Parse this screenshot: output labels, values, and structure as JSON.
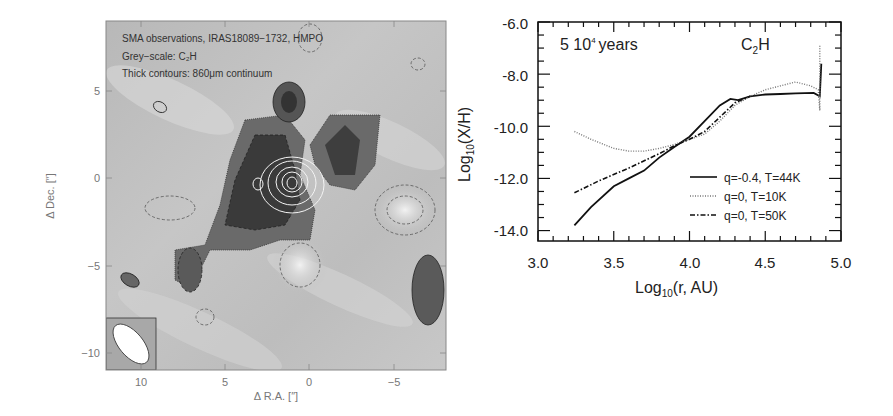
{
  "left_panel": {
    "annotations": [
      "SMA observations, IRAS18089−1732, HMPO",
      "Grey−scale: C₂H",
      "Thick contours: 860μm continuum"
    ],
    "xlabel": "Δ R.A. [″]",
    "ylabel": "Δ Dec. [″]",
    "xticks": [
      "10",
      "5",
      "0",
      "−5"
    ],
    "yticks": [
      "5",
      "0",
      "−5",
      "−10"
    ]
  },
  "chart_data": [
    {
      "type": "image",
      "title": "SMA observations, IRAS18089-1732, HMPO",
      "subtitle": [
        "Grey-scale: C2H",
        "Thick contours: 860μm continuum"
      ],
      "xlabel": "Δ R.A. [″]",
      "ylabel": "Δ Dec. [″]",
      "xlim": [
        12,
        -8
      ],
      "ylim": [
        -11,
        8.5
      ],
      "xticks": [
        10,
        5,
        0,
        -5
      ],
      "yticks": [
        5,
        0,
        -5,
        -10
      ]
    },
    {
      "type": "line",
      "title": "5 10⁴ years",
      "species": "C₂H",
      "xlabel": "Log₁₀(r, AU)",
      "ylabel": "Log₁₀(X/H)",
      "xlim": [
        3.0,
        5.0
      ],
      "ylim": [
        -14.4,
        -6.0
      ],
      "xticks": [
        "3.0",
        "3.5",
        "4.0",
        "4.5",
        "5.0"
      ],
      "yticks": [
        "-6.0",
        "-8.0",
        "-10.0",
        "-12.0",
        "-14.0"
      ],
      "legend_position": "lower right",
      "series": [
        {
          "name": "q=-0.4, T=44K",
          "style": "solid",
          "x": [
            3.24,
            3.35,
            3.5,
            3.6,
            3.7,
            3.8,
            3.9,
            4.0,
            4.1,
            4.2,
            4.27,
            4.32,
            4.4,
            4.5,
            4.6,
            4.7,
            4.82,
            4.86,
            4.87
          ],
          "y": [
            -13.8,
            -13.1,
            -12.3,
            -12.0,
            -11.7,
            -11.2,
            -10.8,
            -10.4,
            -9.8,
            -9.2,
            -8.95,
            -9.0,
            -8.85,
            -8.78,
            -8.76,
            -8.74,
            -8.72,
            -8.85,
            -7.6
          ]
        },
        {
          "name": "q=0, T=10K",
          "style": "dotted",
          "x": [
            3.24,
            3.35,
            3.5,
            3.6,
            3.7,
            3.8,
            3.9,
            4.0,
            4.1,
            4.2,
            4.3,
            4.4,
            4.5,
            4.6,
            4.7,
            4.8,
            4.85,
            4.86,
            4.86
          ],
          "y": [
            -10.2,
            -10.5,
            -10.85,
            -10.95,
            -10.95,
            -10.85,
            -10.7,
            -10.5,
            -10.3,
            -9.8,
            -9.2,
            -8.85,
            -8.6,
            -8.45,
            -8.3,
            -8.45,
            -8.6,
            -9.4,
            -6.9
          ]
        },
        {
          "name": "q=0, T=50K",
          "style": "dashdot",
          "x": [
            3.24,
            3.4,
            3.6,
            3.8,
            3.9,
            4.0,
            4.1,
            4.2,
            4.3,
            4.4
          ],
          "y": [
            -12.55,
            -12.1,
            -11.6,
            -11.05,
            -10.75,
            -10.5,
            -10.2,
            -9.65,
            -9.1,
            -8.85
          ]
        }
      ]
    }
  ],
  "right_panel": {
    "title_left": "5 10",
    "title_sup": "4",
    "title_right": "years",
    "species_main": "C",
    "species_sub": "2",
    "species_end": "H",
    "ylabel_main": "Log",
    "ylabel_sub": "10",
    "ylabel_end": "(X/H)",
    "xlabel_main": "Log",
    "xlabel_sub": "10",
    "xlabel_end": "(r, AU)",
    "legend": [
      "q=-0.4, T=44K",
      "q=0, T=10K",
      "q=0, T=50K"
    ]
  }
}
